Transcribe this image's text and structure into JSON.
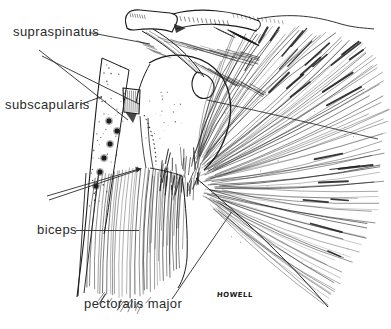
{
  "figure": {
    "type": "anatomical line drawing",
    "labels": {
      "supraspinatus": "supraspinatus",
      "subscapularis": "subscapularis",
      "biceps": "biceps",
      "pectoralis_major": "pectoralis major"
    },
    "signature": "HOWELL",
    "colors": {
      "ink": "#1c1c1c",
      "background": "#ffffff"
    }
  }
}
